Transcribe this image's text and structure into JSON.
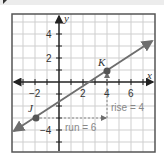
{
  "figure": {
    "axes": {
      "x_label": "x",
      "y_label": "y",
      "x_range": [
        -4,
        8
      ],
      "y_range": [
        -6,
        6
      ]
    },
    "x_ticks": [
      {
        "label": "−2",
        "value": -2
      },
      {
        "label": "2",
        "value": 2
      },
      {
        "label": "4",
        "value": 4
      },
      {
        "label": "6",
        "value": 6
      }
    ],
    "y_ticks": [
      {
        "label": "4",
        "value": 4
      },
      {
        "label": "2",
        "value": 2
      },
      {
        "label": "−4",
        "value": -4
      }
    ],
    "points": [
      {
        "name": "J",
        "x": -2,
        "y": -3
      },
      {
        "name": "K",
        "x": 4,
        "y": 1
      }
    ],
    "annotations": {
      "rise": "rise = 4",
      "run": "run = 6"
    },
    "colors": {
      "line": "#6e6e6e",
      "grid": "#cfcfcf",
      "axis": "#222222",
      "annotation": "#888888"
    }
  }
}
